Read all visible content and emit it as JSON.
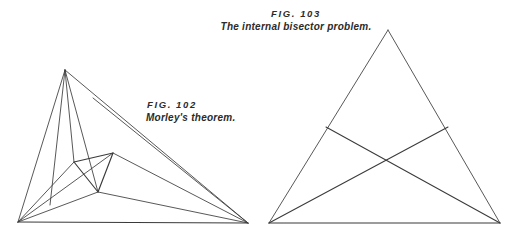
{
  "plate": {
    "background_color": "#ffffff",
    "line_color": "#3a3a3a",
    "text_color": "#2b2b2b",
    "width": 514,
    "height": 240
  },
  "figures": [
    {
      "id": "fig-102",
      "number_label": "FIG. 102",
      "title": "Morley's theorem.",
      "diagram": {
        "type": "angle-trisector-construction",
        "outer_triangle": {
          "A": [
            65,
            70
          ],
          "B": [
            18,
            222
          ],
          "C": [
            248,
            223
          ]
        },
        "inner_equilateral_triangle": {
          "P": [
            74,
            162
          ],
          "Q": [
            113,
            153
          ],
          "R": [
            98,
            192
          ]
        },
        "trisectors": [
          {
            "from": "A",
            "to": [
              50,
              205
            ]
          },
          {
            "from": "A",
            "to": [
              98,
              192
            ]
          },
          {
            "from": "A",
            "to": [
              74,
              162
            ]
          },
          {
            "from": "A",
            "to": [
              113,
              153
            ]
          },
          {
            "from": "B",
            "to": [
              74,
              162
            ]
          },
          {
            "from": "B",
            "to": [
              113,
              153
            ]
          },
          {
            "from": "B",
            "to": [
              98,
              192
            ]
          },
          {
            "from": "C",
            "to": [
              74,
              162
            ]
          },
          {
            "from": "C",
            "to": [
              113,
              153
            ]
          },
          {
            "from": "C",
            "to": [
              98,
              192
            ]
          },
          {
            "from": "C",
            "to": [
              93,
              98
            ]
          }
        ]
      }
    },
    {
      "id": "fig-103",
      "number_label": "FIG. 103",
      "title": "The internal bisector problem.",
      "diagram": {
        "type": "internal-bisector-construction",
        "outer_triangle": {
          "A": [
            388,
            30
          ],
          "B": [
            269,
            223
          ],
          "C": [
            500,
            223
          ]
        },
        "bisectors": [
          {
            "from": "B",
            "to": [
              448,
              127
            ],
            "note": "bisector from left base vertex to right side"
          },
          {
            "from": "C",
            "to": [
              326,
              127
            ],
            "note": "bisector from right base vertex to left side"
          }
        ],
        "intersection_point": [
          383,
          163
        ]
      }
    }
  ]
}
